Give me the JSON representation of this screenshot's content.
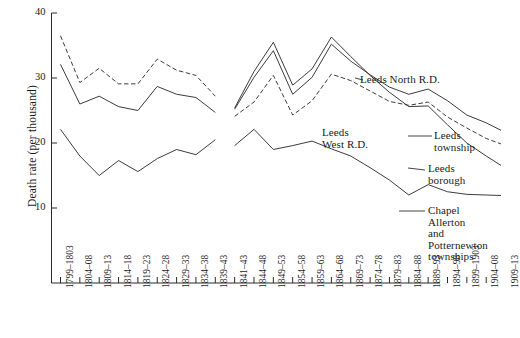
{
  "chart_data": {
    "type": "line",
    "title": "",
    "xlabel": "",
    "ylabel": "Death rate (per thousand)",
    "ylim": [
      0,
      40
    ],
    "yticks": [
      10,
      20,
      30,
      40
    ],
    "grid": false,
    "legend_position": "right-inline-annotations",
    "categories": [
      "1799–1803",
      "1804–08",
      "1809–13",
      "1814–18",
      "1819–23",
      "1824–28",
      "1829–33",
      "1834–38",
      "1839–43",
      "1841–43",
      "1844–48",
      "1849–53",
      "1854–58",
      "1859–63",
      "1864–68",
      "1869–73",
      "1874–78",
      "1879–83",
      "1884–88",
      "1889–93",
      "1894–98",
      "1899–1903",
      "1904–08",
      "1909–13"
    ],
    "series": [
      {
        "name": "Leeds township",
        "style": "dashed",
        "color": "#303030",
        "x": [
          "1799–1803",
          "1804–08",
          "1809–13",
          "1814–18",
          "1819–23",
          "1824–28",
          "1829–33",
          "1834–38",
          "1839–43"
        ],
        "values": [
          36.5,
          29.3,
          31.5,
          29.1,
          29.1,
          32.9,
          31.2,
          30.4,
          27.2
        ]
      },
      {
        "name": "Leeds township (later)",
        "style": "dashed",
        "color": "#303030",
        "x": [
          "1841–43",
          "1844–48",
          "1849–53",
          "1854–58",
          "1859–63",
          "1864–68",
          "1869–73",
          "1874–78",
          "1879–83",
          "1884–88",
          "1889–93",
          "1894–98",
          "1899–1903",
          "1904–08",
          "1909–13"
        ],
        "values": [
          24.1,
          26.3,
          30.4,
          24.3,
          26.5,
          30.6,
          29.6,
          28.0,
          26.4,
          25.8,
          26.3,
          24.0,
          22.3,
          20.7,
          19.6
        ]
      },
      {
        "name": "Leeds North R.D.",
        "style": "solid",
        "color": "#303030",
        "x": [
          "1799–1803",
          "1804–08",
          "1809–13",
          "1814–18",
          "1819–23",
          "1824–28",
          "1829–33",
          "1834–38",
          "1839–43"
        ],
        "values": [
          32.1,
          26.0,
          27.2,
          25.6,
          25.0,
          28.7,
          27.5,
          27.0,
          24.7
        ]
      },
      {
        "name": "Leeds North R.D. (later)",
        "style": "solid",
        "color": "#303030",
        "x": [
          "1841–43",
          "1844–48",
          "1849–53",
          "1854–58",
          "1859–63",
          "1864–68",
          "1869–73",
          "1874–78",
          "1879–83",
          "1884–88",
          "1889–93",
          "1894–98",
          "1899–1903",
          "1904–08",
          "1909–13"
        ],
        "values": [
          25.2,
          30.1,
          34.2,
          27.5,
          30.1,
          35.2,
          32.6,
          30.5,
          28.6,
          27.5,
          28.3,
          26.5,
          24.3,
          23.1,
          21.6
        ]
      },
      {
        "name": "Leeds borough",
        "style": "solid",
        "color": "#303030",
        "x": [
          "1841–43",
          "1844–48",
          "1849–53",
          "1854–58",
          "1859–63",
          "1864–68",
          "1869–73",
          "1874–78",
          "1879–83",
          "1884–88",
          "1889–93",
          "1894–98",
          "1899–1903",
          "1904–08",
          "1909–13"
        ],
        "values": [
          25.4,
          31.0,
          35.5,
          28.9,
          31.4,
          36.3,
          33.3,
          30.4,
          27.8,
          25.6,
          25.7,
          22.8,
          20.0,
          18.0,
          16.1
        ]
      },
      {
        "name": "Chapel Allerton and Potternewton townships",
        "style": "solid",
        "color": "#303030",
        "x": [
          "1799–1803",
          "1804–08",
          "1809–13",
          "1814–18",
          "1819–23",
          "1824–28",
          "1829–33",
          "1834–38",
          "1839–43"
        ],
        "values": [
          22.1,
          18.0,
          15.0,
          17.3,
          15.6,
          17.6,
          19.0,
          18.2,
          20.5
        ]
      },
      {
        "name": "Chapel Allerton and Potternewton townships (later)",
        "style": "solid",
        "color": "#303030",
        "x": [
          "1841–43",
          "1844–48",
          "1849–53",
          "1854–58",
          "1859–63",
          "1864–68",
          "1869–73",
          "1874–78",
          "1879–83",
          "1884–88",
          "1889–93",
          "1894–98",
          "1899–1903",
          "1904–08",
          "1909–13"
        ],
        "values": [
          19.6,
          22.1,
          19.0,
          19.6,
          20.3,
          19.1,
          18.0,
          16.2,
          14.3,
          12.0,
          13.6,
          12.5,
          12.1,
          12.0,
          11.9
        ]
      }
    ],
    "annotations": [
      {
        "id": "leeds-north-rd",
        "text": "Leeds North R.D."
      },
      {
        "id": "leeds-west-rd",
        "text": "Leeds\nWest R.D."
      },
      {
        "id": "leeds-township",
        "text": "Leeds\ntownship"
      },
      {
        "id": "leeds-borough",
        "text": "Leeds\nborough"
      },
      {
        "id": "chapel-allerton",
        "text": "Chapel\nAllerton\nand\nPotternewton\ntownships"
      }
    ]
  },
  "axes": {
    "y": {
      "label": "Death rate (per thousand)",
      "ticks": [
        "40",
        "30",
        "20",
        "10"
      ]
    },
    "x": {
      "ticks": [
        "1799–1803",
        "1804–08",
        "1809–13",
        "1814–18",
        "1819–23",
        "1824–28",
        "1829–33",
        "1834–38",
        "1839–43",
        "1841–43",
        "1844–48",
        "1849–53",
        "1854–58",
        "1859–63",
        "1864–68",
        "1869–73",
        "1874–78",
        "1879–83",
        "1884–88",
        "1889–93",
        "1894–98",
        "1899–1903",
        "1904–08",
        "1909–13"
      ]
    }
  },
  "labels": {
    "leeds_north_rd": "Leeds North R.D.",
    "leeds_west_rd_line1": "Leeds",
    "leeds_west_rd_line2": "West R.D.",
    "leeds_township_line1": "Leeds",
    "leeds_township_line2": "township",
    "leeds_borough_line1": "Leeds",
    "leeds_borough_line2": "borough",
    "chapel_line1": "Chapel",
    "chapel_line2": "Allerton",
    "chapel_line3": "and",
    "chapel_line4": "Potternewton",
    "chapel_line5": "townships"
  },
  "colors": {
    "axis": "#2b2b2b",
    "line": "#303030",
    "background": "#ffffff"
  }
}
